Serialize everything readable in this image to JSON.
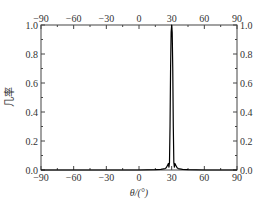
{
  "chart_data": {
    "type": "line",
    "title": "",
    "xlabel": "θ/(°)",
    "ylabel": "几率",
    "xlim": [
      -90,
      90
    ],
    "ylim": [
      0,
      1.0
    ],
    "x_ticks": [
      -90,
      -60,
      -30,
      0,
      30,
      60,
      90
    ],
    "y_ticks": [
      0.0,
      0.2,
      0.4,
      0.6,
      0.8,
      1.0
    ],
    "x_tick_labels": [
      "−90",
      "−60",
      "−30",
      "0",
      "30",
      "60",
      "90"
    ],
    "y_tick_labels": [
      "0.0",
      "0.2",
      "0.4",
      "0.6",
      "0.8",
      "1.0"
    ],
    "top_axis_mirrored": true,
    "right_axis_mirrored": true,
    "grid": false,
    "legend": null,
    "series": [
      {
        "name": "probability",
        "color": "#000000",
        "x": [
          -90,
          -60,
          -30,
          0,
          15,
          20,
          24,
          25,
          26,
          27,
          27.5,
          28,
          28.5,
          29,
          29.5,
          30,
          30.5,
          31,
          31.5,
          32,
          32.5,
          33,
          34,
          35,
          36,
          40,
          45,
          60,
          90
        ],
        "y": [
          0.0,
          0.0,
          0.0,
          0.0,
          0.002,
          0.004,
          0.01,
          0.015,
          0.03,
          0.045,
          0.02,
          0.05,
          0.3,
          0.7,
          0.95,
          1.0,
          0.95,
          0.7,
          0.3,
          0.05,
          0.02,
          0.045,
          0.03,
          0.015,
          0.01,
          0.004,
          0.002,
          0.0,
          0.0
        ]
      }
    ],
    "annotations": [
      {
        "text": "Sharp peak at θ = 30°",
        "x": 30,
        "y": 1.0
      }
    ]
  }
}
